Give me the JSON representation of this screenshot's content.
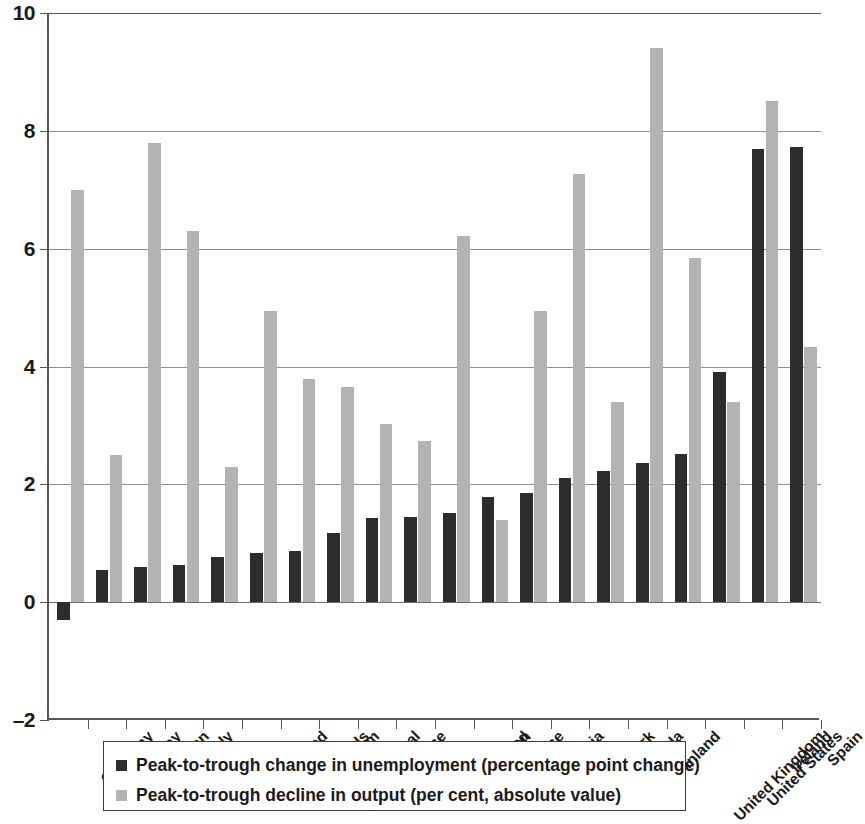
{
  "chart_data": {
    "type": "bar",
    "title": "",
    "subtitle": "",
    "xlabel": "",
    "ylabel": "",
    "ylim": [
      -2,
      10
    ],
    "yticks": [
      10,
      8,
      6,
      4,
      2,
      0,
      -2
    ],
    "ytick_labels": [
      "10",
      "8",
      "6",
      "4",
      "2",
      "0",
      "–2"
    ],
    "grid": true,
    "legend_position": "bottom",
    "categories": [
      "Germany",
      "Norway",
      "Japan",
      "Italy",
      "Switzerland",
      "Netherlands",
      "Belgium",
      "Portugal",
      "France",
      "New Zealand",
      "Sweden",
      "Greece",
      "Austria",
      "Denmark",
      "Canada",
      "Finland",
      "United Kingdom",
      "United States",
      "Ireland",
      "Spain"
    ],
    "series": [
      {
        "name": "Peak-to-trough change in unemployment (percentage point change)",
        "color": "#2e2d2e",
        "values": [
          -0.3,
          0.55,
          0.6,
          0.63,
          0.77,
          0.83,
          0.87,
          1.17,
          1.43,
          1.45,
          1.52,
          1.79,
          1.86,
          2.1,
          2.23,
          2.37,
          2.52,
          3.9,
          7.7,
          7.73
        ]
      },
      {
        "name": "Peak-to-trough decline in output (per cent, absolute value)",
        "color": "#b3b3b3",
        "values": [
          7.0,
          2.5,
          7.8,
          6.3,
          2.3,
          4.95,
          3.78,
          3.66,
          3.02,
          2.73,
          6.22,
          1.4,
          4.95,
          7.27,
          3.4,
          9.4,
          5.85,
          3.4,
          8.5,
          4.33
        ]
      }
    ]
  },
  "legend": {
    "items": [
      {
        "marker": "dark-square-marker",
        "label": "Peak-to-trough change in unemployment (percentage point change)"
      },
      {
        "marker": "light-square-marker",
        "label": "Peak-to-trough decline in output (per cent, absolute value)"
      }
    ]
  }
}
